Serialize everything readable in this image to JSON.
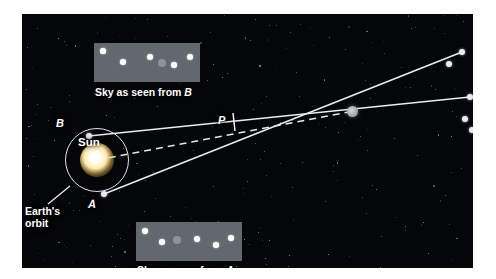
{
  "figure": {
    "background_color": "#050608",
    "line_color": "#e8ecf1",
    "panel_color": "#63686e",
    "page_background": "#ffffff"
  },
  "labels": {
    "sun": "Sun",
    "point_b": "B",
    "point_a": "A",
    "parallax_angle": "P",
    "orbit_line1": "Earth's",
    "orbit_line2": "orbit"
  },
  "captions": {
    "top_prefix": "Sky as seen from ",
    "top_point": "B",
    "bottom_prefix": "Sky as seen from ",
    "bottom_point": "A"
  },
  "sky_from_b": {
    "panel": {
      "x": 72,
      "y": 29,
      "w": 106,
      "h": 39
    },
    "stars": [
      {
        "x": 9,
        "y": 8,
        "r": 2.6,
        "type": "white"
      },
      {
        "x": 29,
        "y": 19,
        "r": 2.8,
        "type": "white"
      },
      {
        "x": 56,
        "y": 14,
        "r": 3.0,
        "type": "white"
      },
      {
        "x": 68,
        "y": 20,
        "r": 4.3,
        "type": "gray"
      },
      {
        "x": 80,
        "y": 22,
        "r": 2.8,
        "type": "white"
      },
      {
        "x": 96,
        "y": 14,
        "r": 3.0,
        "type": "white"
      }
    ]
  },
  "sky_from_a": {
    "panel": {
      "x": 114,
      "y": 208,
      "w": 106,
      "h": 39
    },
    "stars": [
      {
        "x": 9,
        "y": 9,
        "r": 2.8,
        "type": "white"
      },
      {
        "x": 26,
        "y": 20,
        "r": 2.8,
        "type": "white"
      },
      {
        "x": 41,
        "y": 18,
        "r": 4.3,
        "type": "gray"
      },
      {
        "x": 61,
        "y": 17,
        "r": 2.9,
        "type": "white"
      },
      {
        "x": 80,
        "y": 23,
        "r": 2.8,
        "type": "white"
      },
      {
        "x": 95,
        "y": 16,
        "r": 2.9,
        "type": "white"
      }
    ]
  },
  "geometry": {
    "orbit": {
      "cx": 75,
      "cy": 146,
      "r": 32
    },
    "sun": {
      "cx": 75,
      "cy": 146,
      "r": 9
    },
    "node_b": {
      "x": 67,
      "y": 122
    },
    "node_a": {
      "x": 82,
      "y": 180
    },
    "target_star": {
      "x": 330,
      "y": 97
    },
    "background_stars": [
      {
        "x": 440,
        "y": 38,
        "r": 3.1
      },
      {
        "x": 427,
        "y": 50,
        "r": 3.0
      },
      {
        "x": 448,
        "y": 83,
        "r": 3.1
      },
      {
        "x": 443,
        "y": 105,
        "r": 3.0
      },
      {
        "x": 450,
        "y": 116,
        "r": 3.0
      }
    ],
    "sightline_b_to_star_label": "line of sight from B",
    "sightline_a_to_star_label": "line of sight from A",
    "baseline_label": "Sun to star baseline (dashed)"
  }
}
